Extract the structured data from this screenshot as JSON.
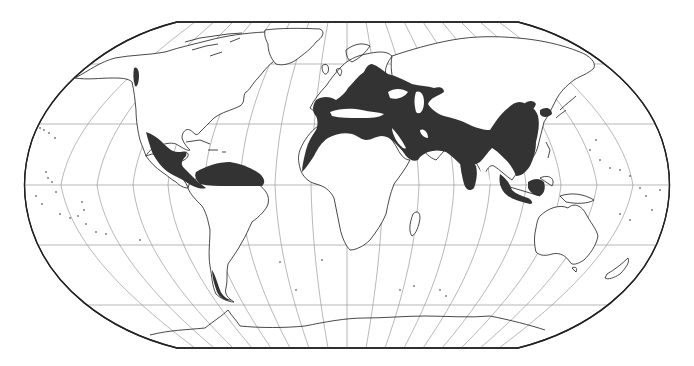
{
  "map": {
    "projection": "Robinson",
    "frame": {
      "left": 25,
      "right": 669,
      "top": 22,
      "bottom": 348,
      "top_x": [
        177,
        518
      ],
      "bottom_x": [
        177,
        518
      ]
    },
    "graticule": {
      "parallels_y": [
        64,
        124,
        185,
        245,
        305
      ],
      "meridian_step_deg": 20,
      "center_x": 347,
      "equator_half_width": 322
    },
    "colors": {
      "background": "#ffffff",
      "frame": "#222222",
      "graticule": "#9a9a9a",
      "coastline": "#1a1a1a",
      "range_fill": "#333333"
    },
    "legend": null,
    "labels": [],
    "shaded_regions": [
      {
        "name": "Mexico and Central America"
      },
      {
        "name": "Northern South America"
      },
      {
        "name": "Iberia and Northwest Africa"
      },
      {
        "name": "Southern and Central Europe"
      },
      {
        "name": "North Africa and Sahara fringe"
      },
      {
        "name": "Middle East and Arabian Peninsula"
      },
      {
        "name": "Central Asia"
      },
      {
        "name": "Indian Subcontinent"
      },
      {
        "name": "China and East Asia"
      },
      {
        "name": "Korea and Japan"
      },
      {
        "name": "Southeast Asia and Indonesia"
      },
      {
        "name": "Alaska panhandle"
      },
      {
        "name": "Southern Chile"
      }
    ]
  }
}
